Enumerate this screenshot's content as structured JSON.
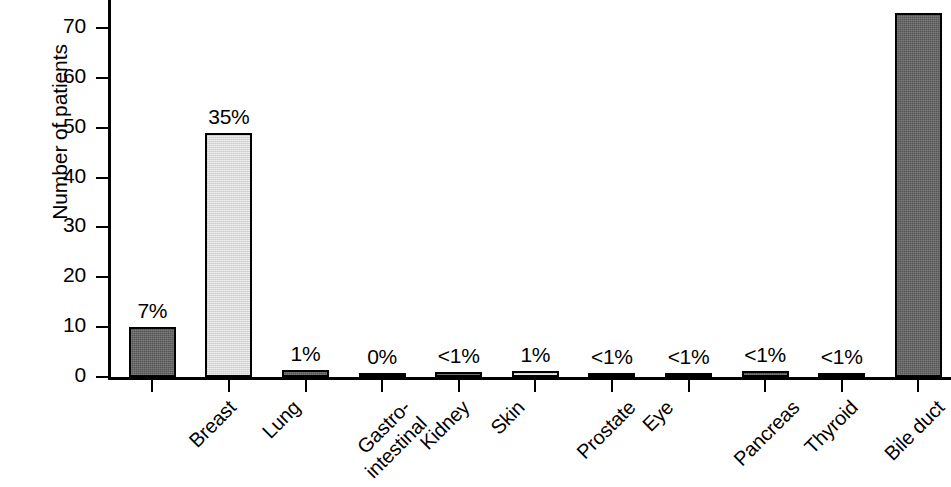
{
  "chart_data": {
    "type": "bar",
    "title": "",
    "xlabel": "",
    "ylabel": "Number of patients",
    "ylim": [
      0,
      75
    ],
    "yticks": [
      0,
      10,
      20,
      30,
      40,
      50,
      60,
      70
    ],
    "ytick_labels": [
      "0",
      "10",
      "20",
      "30",
      "40",
      "50",
      "60",
      "70"
    ],
    "grid": false,
    "legend": "none",
    "categories": [
      "Breast",
      "Lung",
      "Gastro-intestinal",
      "Kidney",
      "Skin",
      "Prostate",
      "Eye",
      "Pancreas",
      "Thyroid",
      "Bile duct",
      "Unknown"
    ],
    "category_label_lines": [
      [
        "Breast"
      ],
      [
        "Lung"
      ],
      [
        "Gastro-",
        "intestinal"
      ],
      [
        "Kidney"
      ],
      [
        "Skin"
      ],
      [
        "Prostate"
      ],
      [
        "Eye"
      ],
      [
        "Pancreas"
      ],
      [
        "Thyroid"
      ],
      [
        "Bile duct"
      ],
      [
        "Unknown"
      ]
    ],
    "values": [
      10,
      49,
      1.5,
      0.3,
      1,
      1.2,
      0.8,
      0.8,
      1.2,
      0.8,
      73
    ],
    "data_labels": [
      "7%",
      "35%",
      "1%",
      "0%",
      "<1%",
      "1%",
      "<1%",
      "<1%",
      "<1%",
      "<1%",
      ""
    ],
    "bar_shades": [
      "dark",
      "light",
      "dark",
      "dark",
      "dark",
      "light",
      "dark",
      "dark",
      "dark",
      "light",
      "dark"
    ],
    "colors": {
      "dark_fill": "#555555",
      "light_fill": "#d7d7d7",
      "outline": "#000000",
      "axis": "#000000",
      "background": "#ffffff"
    }
  }
}
